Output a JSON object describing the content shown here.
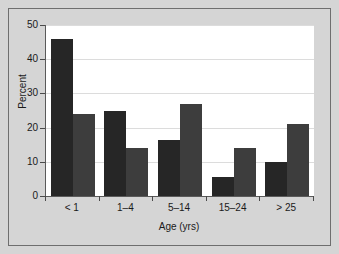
{
  "chart_data": {
    "type": "bar",
    "title": "",
    "subtitle": "",
    "xlabel": "Age (yrs)",
    "ylabel": "Percent",
    "categories": [
      "< 1",
      "1–4",
      "5–14",
      "15–24",
      "> 25"
    ],
    "series": [
      {
        "name": "series-1",
        "color": "#262626",
        "values": [
          46,
          25,
          16.5,
          5.5,
          10
        ]
      },
      {
        "name": "series-2",
        "color": "#3d3d3d",
        "values": [
          24,
          14,
          27,
          14,
          21
        ]
      }
    ],
    "ylim": [
      0,
      50
    ],
    "yticks": [
      0,
      10,
      20,
      30,
      40,
      50
    ],
    "ytick_labels": [
      "0",
      "10",
      "20",
      "30",
      "40",
      "50"
    ],
    "grid": true,
    "legend": "none",
    "colors": {
      "page_background": "#d5d5d5",
      "plot_background": "#ffffff",
      "frame_border": "#6e6e6e",
      "axis": "#5a5a5a",
      "gridline": "#dcdcdc",
      "text": "#1a1a1a"
    }
  }
}
